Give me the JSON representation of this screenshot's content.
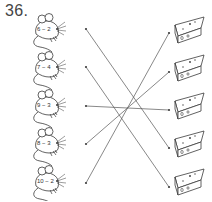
{
  "exercise": {
    "number": "36."
  },
  "mice": [
    {
      "expression": "6 − 2",
      "dot": {
        "x": 86,
        "y": 29
      },
      "y": 14
    },
    {
      "expression": "7 − 4",
      "dot": {
        "x": 86,
        "y": 67
      },
      "y": 52
    },
    {
      "expression": "9 − 3",
      "dot": {
        "x": 86,
        "y": 106
      },
      "y": 90
    },
    {
      "expression": "8 − 3",
      "dot": {
        "x": 86,
        "y": 144
      },
      "y": 128
    },
    {
      "expression": "10 − 2",
      "dot": {
        "x": 86,
        "y": 183
      },
      "y": 166
    }
  ],
  "cheeses": [
    {
      "dot": {
        "x": 169,
        "y": 33
      },
      "y": 14
    },
    {
      "dot": {
        "x": 169,
        "y": 72
      },
      "y": 52
    },
    {
      "dot": {
        "x": 169,
        "y": 110
      },
      "y": 90
    },
    {
      "dot": {
        "x": 169,
        "y": 148
      },
      "y": 128
    },
    {
      "dot": {
        "x": 169,
        "y": 187
      },
      "y": 166
    }
  ],
  "connections": [
    {
      "from": 0,
      "to": 3
    },
    {
      "from": 1,
      "to": 4
    },
    {
      "from": 2,
      "to": 2
    },
    {
      "from": 3,
      "to": 1
    },
    {
      "from": 4,
      "to": 0
    }
  ],
  "colors": {
    "ink": "#3a3a3a",
    "line": "#555555"
  }
}
